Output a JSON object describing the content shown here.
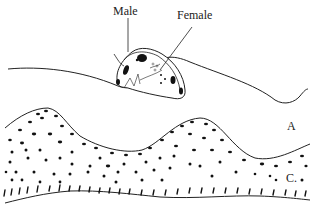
{
  "diagram": {
    "labels": {
      "male": "Male",
      "female": "Female",
      "layer_a": "A",
      "layer_c": "C."
    },
    "colors": {
      "stroke": "#222222",
      "background": "#ffffff"
    }
  }
}
